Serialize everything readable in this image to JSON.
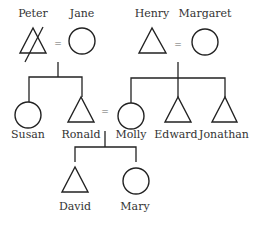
{
  "diagram": {
    "type": "family-tree",
    "legend_implicit": {
      "triangle": "male",
      "circle": "female",
      "equals": "marriage",
      "strike": "deceased"
    },
    "people": {
      "peter": {
        "name": "Peter",
        "shape": "triangle",
        "crossed": true
      },
      "jane": {
        "name": "Jane",
        "shape": "circle"
      },
      "henry": {
        "name": "Henry",
        "shape": "triangle"
      },
      "margaret": {
        "name": "Margaret",
        "shape": "circle"
      },
      "susan": {
        "name": "Susan",
        "shape": "circle"
      },
      "ronald": {
        "name": "Ronald",
        "shape": "triangle"
      },
      "molly": {
        "name": "Molly",
        "shape": "circle"
      },
      "edward": {
        "name": "Edward",
        "shape": "triangle"
      },
      "jonathan": {
        "name": "Jonathan",
        "shape": "triangle"
      },
      "david": {
        "name": "David",
        "shape": "triangle"
      },
      "mary": {
        "name": "Mary",
        "shape": "circle"
      }
    },
    "marriages": [
      {
        "a": "Peter",
        "b": "Jane",
        "symbol": "="
      },
      {
        "a": "Henry",
        "b": "Margaret",
        "symbol": "="
      },
      {
        "a": "Ronald",
        "b": "Molly",
        "symbol": "="
      }
    ],
    "children": [
      {
        "parents": [
          "Peter",
          "Jane"
        ],
        "children": [
          "Susan",
          "Ronald"
        ]
      },
      {
        "parents": [
          "Henry",
          "Margaret"
        ],
        "children": [
          "Molly",
          "Edward",
          "Jonathan"
        ]
      },
      {
        "parents": [
          "Ronald",
          "Molly"
        ],
        "children": [
          "David",
          "Mary"
        ]
      }
    ]
  }
}
